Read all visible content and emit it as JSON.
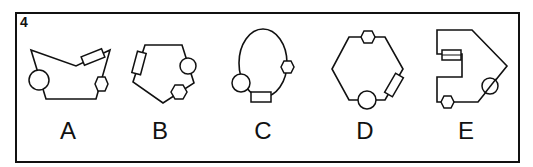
{
  "question": {
    "number": "4"
  },
  "options": [
    {
      "label": "A",
      "outline": "concave pentagon (V-notched top)",
      "components": [
        "circle",
        "rectangle",
        "hexagon"
      ]
    },
    {
      "label": "B",
      "outline": "pentagon",
      "components": [
        "rectangle",
        "circle",
        "hexagon"
      ]
    },
    {
      "label": "C",
      "outline": "ellipse",
      "components": [
        "circle",
        "hexagon",
        "rectangle"
      ]
    },
    {
      "label": "D",
      "outline": "hexagon",
      "components": [
        "hexagon",
        "rectangle",
        "circle"
      ]
    },
    {
      "label": "E",
      "outline": "notched polygon",
      "components": [
        "rectangle",
        "circle",
        "hexagon"
      ]
    }
  ],
  "colors": {
    "stroke": "#111111",
    "background": "#ffffff"
  }
}
